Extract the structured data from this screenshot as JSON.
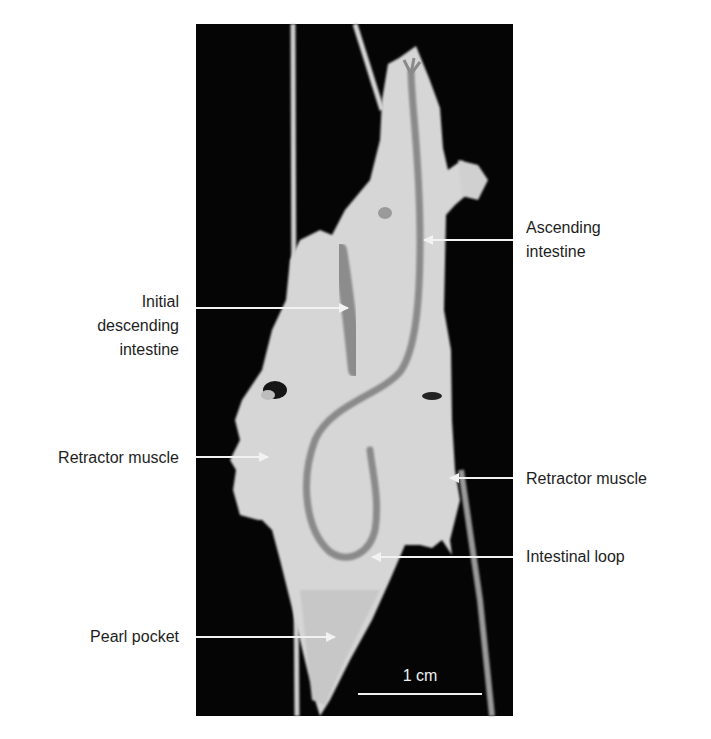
{
  "figure": {
    "photo_background": "#050505",
    "tissue_color": "#d9d9d9",
    "intestine_color": "#8a8a8a",
    "arrow_color": "#f2f2f2",
    "text_color": "#1e1e1e",
    "scale_bar": {
      "label": "1 cm"
    },
    "labels": [
      {
        "id": "ascending-intestine",
        "lines": [
          "Ascending",
          "intestine"
        ],
        "side": "right"
      },
      {
        "id": "initial-descending-intestine",
        "lines": [
          "Initial",
          "descending",
          "intestine"
        ],
        "side": "left"
      },
      {
        "id": "retractor-muscle-left",
        "lines": [
          "Retractor muscle"
        ],
        "side": "left"
      },
      {
        "id": "retractor-muscle-right",
        "lines": [
          "Retractor muscle"
        ],
        "side": "right"
      },
      {
        "id": "intestinal-loop",
        "lines": [
          "Intestinal loop"
        ],
        "side": "right"
      },
      {
        "id": "pearl-pocket",
        "lines": [
          "Pearl pocket"
        ],
        "side": "left"
      }
    ]
  }
}
